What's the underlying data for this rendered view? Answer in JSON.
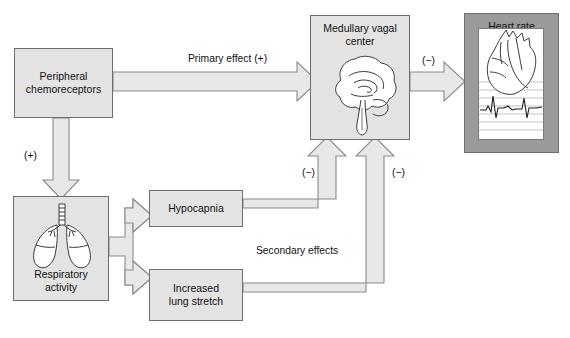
{
  "diagram": {
    "colors": {
      "box_fill": "#e3e3e3",
      "box_stroke": "#6f6f6f",
      "arrow_fill": "#e8e8e8",
      "arrow_stroke": "#808080",
      "heart_panel_fill": "#9a9a9a",
      "text": "#111111",
      "background": "#ffffff"
    },
    "nodes": [
      {
        "id": "peripheral-chemoreceptors",
        "label": "Peripheral\nchemoreceptors",
        "line1": "Peripheral",
        "line2": "chemoreceptors",
        "x": 14,
        "y": 48,
        "w": 99,
        "h": 70,
        "illustration": "none"
      },
      {
        "id": "respiratory-activity",
        "label": "Respiratory\nactivity",
        "line1": "Respiratory",
        "line2": "activity",
        "x": 13,
        "y": 196,
        "w": 96,
        "h": 105,
        "illustration": "lungs-icon"
      },
      {
        "id": "hypocapnia",
        "label": "Hypocapnia",
        "line1": "Hypocapnia",
        "line2": "",
        "x": 149,
        "y": 190,
        "w": 94,
        "h": 37,
        "illustration": "none"
      },
      {
        "id": "increased-lung-stretch",
        "label": "Increased\nlung stretch",
        "line1": "Increased",
        "line2": "lung stretch",
        "x": 149,
        "y": 269,
        "w": 94,
        "h": 52,
        "illustration": "none"
      },
      {
        "id": "medullary-vagal-center",
        "label": "Medullary vagal\ncenter",
        "line1": "Medullary vagal",
        "line2": "center",
        "x": 310,
        "y": 15,
        "w": 100,
        "h": 125,
        "illustration": "brain-icon"
      },
      {
        "id": "heart-rate",
        "label": "Heart rate",
        "line1": "Heart rate",
        "line2": "",
        "x": 464,
        "y": 13,
        "w": 95,
        "h": 140,
        "illustration": "heart-ecg-icon"
      }
    ],
    "edges": [
      {
        "id": "chemoreceptors-to-medulla",
        "from": "peripheral-chemoreceptors",
        "to": "medullary-vagal-center",
        "label": "Primary effect (+)",
        "sign": "(+)",
        "direction": "right"
      },
      {
        "id": "medulla-to-heart",
        "from": "medullary-vagal-center",
        "to": "heart-rate",
        "label": "(−)",
        "sign": "(−)",
        "direction": "right"
      },
      {
        "id": "chemoreceptors-to-respiratory",
        "from": "peripheral-chemoreceptors",
        "to": "respiratory-activity",
        "label": "(+)",
        "sign": "(+)",
        "direction": "down"
      },
      {
        "id": "respiratory-to-hypocapnia",
        "from": "respiratory-activity",
        "to": "hypocapnia",
        "label": "",
        "sign": "",
        "direction": "right"
      },
      {
        "id": "respiratory-to-lung-stretch",
        "from": "respiratory-activity",
        "to": "increased-lung-stretch",
        "label": "",
        "sign": "",
        "direction": "right"
      },
      {
        "id": "hypocapnia-to-medulla",
        "from": "hypocapnia",
        "to": "medullary-vagal-center",
        "label": "(−)",
        "sign": "(−)",
        "direction": "up"
      },
      {
        "id": "lung-stretch-to-medulla",
        "from": "increased-lung-stretch",
        "to": "medullary-vagal-center",
        "label": "(−)",
        "sign": "(−)",
        "direction": "up"
      }
    ],
    "labels": {
      "primary_effect": "Primary effect (+)",
      "secondary_effects": "Secondary effects",
      "sign_plus_left": "(+)",
      "sign_minus_heart": "(−)",
      "sign_minus_hypocapnia": "(−)",
      "sign_minus_lung_stretch": "(−)"
    }
  }
}
